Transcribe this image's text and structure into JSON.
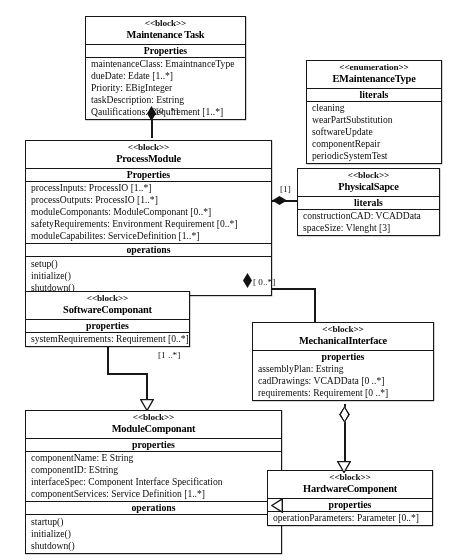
{
  "diagram": {
    "caption": "",
    "blocks": {
      "maintenance_task": {
        "stereotype": "<<block>>",
        "name": "Maintenance Task",
        "compartments": [
          {
            "title": "Properties",
            "features": [
              "maintenanceClass: EmaintnanceType",
              "dueDate: Edate [1..*]",
              "Priority: EBigInteger",
              "taskDescription: Estring",
              "Qaulifications: Requirement [1..*]"
            ]
          }
        ]
      },
      "emaintenance_type": {
        "stereotype": "<<enumeration>>",
        "name": "EMaintenanceType",
        "compartments": [
          {
            "title": "literals",
            "features": [
              "cleaning",
              "wearPartSubstitution",
              "softwareUpdate",
              "componentRepair",
              "periodicSystemTest"
            ]
          }
        ]
      },
      "process_module": {
        "stereotype": "<<block>>",
        "name": "ProcessModule",
        "compartments": [
          {
            "title": "Properties",
            "features": [
              "processInputs: ProcessIO [1..*]",
              "processOutputs: ProcessIO [1..*]",
              "moduleComponants: ModuleComponant [0..*]",
              "safetyRequirements: Environment Requirement [0..*]",
              "moduleCapabilites: ServiceDefinition [1..*]"
            ]
          },
          {
            "title": "operations",
            "features": [
              "setup()",
              "initialize()",
              "shutdown()"
            ]
          }
        ]
      },
      "physical_space": {
        "stereotype": "<<block>>",
        "name": "PhysicalSapce",
        "compartments": [
          {
            "title": "literals",
            "features": [
              "constructionCAD: VCADData",
              "spaceSize: Vlenght [3]"
            ]
          }
        ]
      },
      "software_componant": {
        "stereotype": "<<block>>",
        "name": "SoftwareComponant",
        "compartments": [
          {
            "title": "properties",
            "features": [
              "systemRequirements: Requirement [0..*]"
            ]
          }
        ]
      },
      "mechanical_interface": {
        "stereotype": "<<block>>",
        "name": "MechanicalInterface",
        "compartments": [
          {
            "title": "properties",
            "features": [
              "assemblyPlan: Estring",
              "cadDrawings: VCADData [0 ..*]",
              "requirements: Requirement [0 ..*]"
            ]
          }
        ]
      },
      "module_componant": {
        "stereotype": "<<block>>",
        "name": "ModuleComponant",
        "compartments": [
          {
            "title": "properties",
            "features": [
              "componentName: E String",
              "componentID: EString",
              "interfaceSpec: Component Interface Specification",
              "componentServices: Service Definition [1..*]"
            ]
          },
          {
            "title": "operations",
            "features": [
              "startup()",
              "initialize()",
              "shutdown()"
            ]
          }
        ]
      },
      "hardware_component": {
        "stereotype": "<<block>>",
        "name": "HardwareComponent",
        "compartments": [
          {
            "title": "properties",
            "features": [
              "operationParameters: Parameter [0..*]"
            ]
          }
        ]
      }
    },
    "multiplicities": {
      "task_to_module": "[0 ..*]",
      "module_to_space": "[1]",
      "module_to_mechanical": "[ 0..*]",
      "software_to_module": "[1 ..*]"
    }
  }
}
